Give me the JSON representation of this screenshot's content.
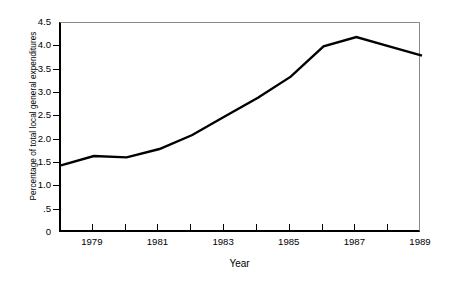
{
  "chart_data": {
    "type": "line",
    "title": "",
    "xlabel": "Year",
    "ylabel": "Percentage of total local general expenditures",
    "xlim": [
      1978,
      1989
    ],
    "ylim": [
      0,
      4.5
    ],
    "grid": false,
    "legend": null,
    "x": [
      1978,
      1979,
      1980,
      1981,
      1982,
      1983,
      1984,
      1985,
      1986,
      1987,
      1988,
      1989
    ],
    "values": [
      1.45,
      1.65,
      1.62,
      1.8,
      2.1,
      2.5,
      2.9,
      3.35,
      4.0,
      4.2,
      4.0,
      3.8
    ],
    "series": [
      {
        "name": "Percentage of total local general expenditures",
        "values": [
          1.45,
          1.65,
          1.62,
          1.8,
          2.1,
          2.5,
          2.9,
          3.35,
          4.0,
          4.2,
          4.0,
          3.8
        ],
        "color": "#000000"
      }
    ],
    "y_ticks": [
      {
        "value": 4.5,
        "label": "4.5"
      },
      {
        "value": 4.0,
        "label": "4.0"
      },
      {
        "value": 3.5,
        "label": "3.5"
      },
      {
        "value": 3.0,
        "label": "3.0"
      },
      {
        "value": 2.5,
        "label": "2.5"
      },
      {
        "value": 2.0,
        "label": "2.0"
      },
      {
        "value": 1.5,
        "label": "1.5"
      },
      {
        "value": 1.0,
        "label": "1.0"
      },
      {
        "value": 0.5,
        "label": ".5"
      },
      {
        "value": 0,
        "label": "0"
      }
    ],
    "x_ticks": [
      {
        "value": 1979,
        "label": "1979"
      },
      {
        "value": 1980,
        "label": ""
      },
      {
        "value": 1981,
        "label": "1981"
      },
      {
        "value": 1982,
        "label": ""
      },
      {
        "value": 1983,
        "label": "1983"
      },
      {
        "value": 1984,
        "label": ""
      },
      {
        "value": 1985,
        "label": "1985"
      },
      {
        "value": 1986,
        "label": ""
      },
      {
        "value": 1987,
        "label": "1987"
      },
      {
        "value": 1988,
        "label": ""
      },
      {
        "value": 1989,
        "label": "1989"
      }
    ],
    "line_color": "#000000",
    "background_color": "#ffffff"
  }
}
